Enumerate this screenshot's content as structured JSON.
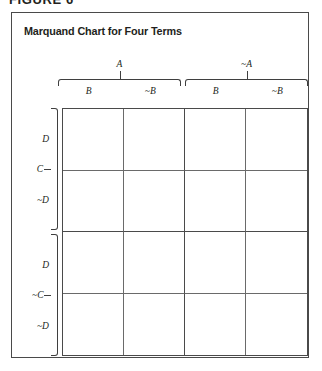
{
  "figure": {
    "caption": "FIGURE 6"
  },
  "chart": {
    "title": "Marquand Chart for Four Terms",
    "columns": {
      "groups": [
        {
          "label": "A",
          "sub": [
            "B",
            "~B"
          ]
        },
        {
          "label": "~A",
          "sub": [
            "B",
            "~B"
          ]
        }
      ]
    },
    "rows": {
      "groups": [
        {
          "label": "C",
          "sub": [
            "D",
            "~D"
          ]
        },
        {
          "label": "~C",
          "sub": [
            "D",
            "~D"
          ]
        }
      ]
    },
    "grid": {
      "rows": 4,
      "cols": 4,
      "cells": [
        [
          "",
          "",
          "",
          ""
        ],
        [
          "",
          "",
          "",
          ""
        ],
        [
          "",
          "",
          "",
          ""
        ],
        [
          "",
          "",
          "",
          ""
        ]
      ]
    }
  },
  "chart_data": {
    "type": "table",
    "title": "Marquand Chart for Four Terms",
    "xlabel": "",
    "ylabel": "",
    "column_groups": [
      "A",
      "~A"
    ],
    "column_subdivisions": [
      "B",
      "~B",
      "B",
      "~B"
    ],
    "row_groups": [
      "C",
      "~C"
    ],
    "row_subdivisions": [
      "D",
      "~D",
      "D",
      "~D"
    ],
    "categories": [
      "A·B",
      "A·~B",
      "~A·B",
      "~A·~B"
    ],
    "row_categories": [
      "C·D",
      "C·~D",
      "~C·D",
      "~C·~D"
    ],
    "values": [
      [
        "",
        "",
        "",
        ""
      ],
      [
        "",
        "",
        "",
        ""
      ],
      [
        "",
        "",
        "",
        ""
      ],
      [
        "",
        "",
        "",
        ""
      ]
    ],
    "grid": true,
    "legend": "none",
    "note": "Empty 4x4 Marquand chart (Karnaugh-style grid) for four logical terms A, B, C, D; all 16 cells are blank."
  },
  "colors": {
    "ink": "#231f20",
    "frame": "#4a4a4a",
    "rule": "#6a6a6a",
    "background": "#ffffff"
  }
}
